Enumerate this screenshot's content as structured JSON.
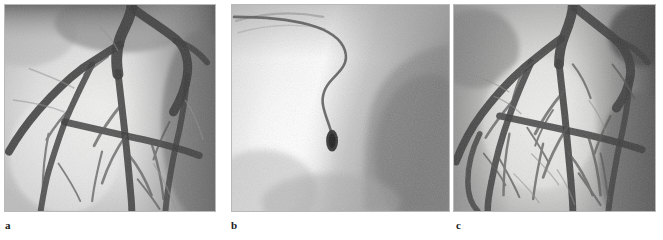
{
  "figure": {
    "type": "medical-image-figure",
    "modality": "coronary angiography",
    "background_color": "#ffffff",
    "border_color": "#b9b9b9",
    "panel_count": 3
  },
  "panels": [
    {
      "id": "a",
      "label": "a",
      "name": "angiogram-panel-a",
      "description": "Coronary angiogram showing left coronary artery tree with stenosis",
      "x": 4,
      "y": 4,
      "width": 212,
      "height": 208,
      "tone": {
        "background_light": "#e8e8e6",
        "background_mid": "#c2c2c0",
        "background_dark": "#6a6a6a",
        "vessel_dark": "#3a3a3a",
        "vessel_mid": "#6d6d6d"
      }
    },
    {
      "id": "b",
      "label": "b",
      "name": "angiogram-panel-b",
      "description": "Fluoroscopic image of guide catheter with inflated balloon device",
      "x": 231,
      "y": 4,
      "width": 219,
      "height": 208,
      "tone": {
        "background_light": "#fbfbfb",
        "background_mid": "#d6d6d6",
        "background_dark": "#8d8d8d",
        "catheter_color": "#5d5d5d",
        "device_color": "#2f2f2f"
      }
    },
    {
      "id": "c",
      "label": "c",
      "name": "angiogram-panel-c",
      "description": "Post-intervention coronary angiogram with restored vessel filling",
      "x": 453,
      "y": 4,
      "width": 203,
      "height": 208,
      "tone": {
        "background_light": "#e4e4e2",
        "background_mid": "#bdbdbb",
        "background_dark": "#5e5e5e",
        "vessel_dark": "#3d3d3d",
        "vessel_mid": "#707070"
      }
    }
  ],
  "labels": {
    "a": "a",
    "b": "b",
    "c": "c"
  }
}
